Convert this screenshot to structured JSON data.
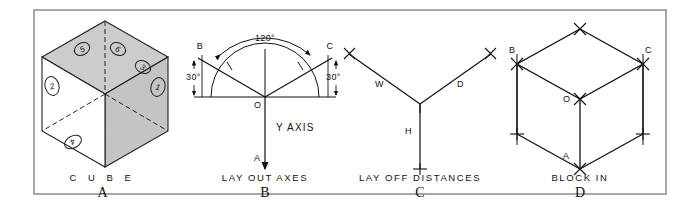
{
  "figure": {
    "border_color": "#a8a8a8",
    "background": "#ffffff",
    "ink_color": "#111111",
    "shade_color": "#c8c8c8"
  },
  "panels": [
    {
      "id": "A",
      "letter": "A",
      "caption": "C U B E",
      "title": "cube",
      "face_numbers": [
        "1",
        "2",
        "3",
        "4",
        "5",
        "6"
      ]
    },
    {
      "id": "B",
      "letter": "B",
      "caption": "LAY OUT AXES",
      "title": "lay out axes",
      "angle_total": "120°",
      "angle_left": "30°",
      "angle_right": "30°",
      "point_left": "B",
      "point_right": "C",
      "point_origin": "O",
      "point_bottom": "A",
      "axis_label": "Y AXIS"
    },
    {
      "id": "C",
      "letter": "C",
      "caption": "LAY OFF DISTANCES",
      "title": "lay off distances",
      "arm_width": "W",
      "arm_depth": "D",
      "arm_height": "H"
    },
    {
      "id": "D",
      "letter": "D",
      "caption": "BLOCK IN",
      "title": "block in",
      "point_left": "B",
      "point_right": "C",
      "point_center": "O",
      "point_bottom": "A"
    }
  ]
}
